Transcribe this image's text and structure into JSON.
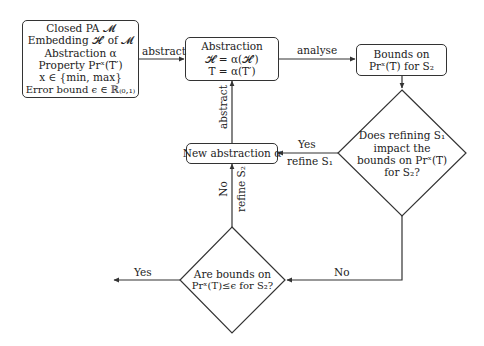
{
  "nodes": {
    "inputs": {
      "lines": [
        "Closed PA 𝓜",
        "Embedding 𝓗′ of 𝓜",
        "Abstraction α",
        "Property Prˣ(T′)",
        "x ∈ {min, max}",
        "Error bound ϵ ∈ ℝ₍₀,₁₎"
      ]
    },
    "abstraction": {
      "lines": [
        "Abstraction",
        "𝓗 = α(𝓗′)",
        "T = α(T′)"
      ]
    },
    "bounds": {
      "lines": [
        "Bounds on",
        "Prˣ(T) for S₂"
      ]
    },
    "decision_refine": {
      "lines": [
        "Does refining S₁",
        "impact the",
        "bounds on Prˣ(T)",
        "for S₂?"
      ]
    },
    "new_abstraction": {
      "lines": [
        "New abstraction α"
      ]
    },
    "decision_error": {
      "lines": [
        "Are bounds on",
        "Prˣ(T)≤ϵ for S₂?"
      ]
    }
  },
  "edges": {
    "inputs_to_abstraction": "abstract",
    "abstraction_to_bounds": "analyse",
    "new_to_abstraction": "abstract",
    "refine_yes": "Yes",
    "refine_yes_action": "refine S₁",
    "refine_no": "No",
    "error_no": "No",
    "error_no_action": "refine S₂",
    "error_yes": "Yes"
  }
}
